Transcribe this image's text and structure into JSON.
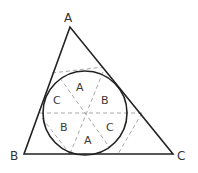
{
  "diagram": {
    "type": "geometry",
    "colors": {
      "solid": "#222222",
      "dashed": "#a0a0a0",
      "background": "#ffffff"
    },
    "vertices": {
      "A": {
        "label": "A",
        "x": 70,
        "y": 27
      },
      "B": {
        "label": "B",
        "x": 24,
        "y": 154
      },
      "C": {
        "label": "C",
        "x": 173,
        "y": 154
      }
    },
    "circle": {
      "cx": 85,
      "cy": 113,
      "r": 42
    },
    "regions": [
      {
        "label": "A",
        "x": 80,
        "y": 89
      },
      {
        "label": "B",
        "x": 105,
        "y": 103
      },
      {
        "label": "C",
        "x": 57,
        "y": 103
      },
      {
        "label": "B",
        "x": 64,
        "y": 130
      },
      {
        "label": "C",
        "x": 110,
        "y": 130
      },
      {
        "label": "A",
        "x": 88,
        "y": 143
      }
    ]
  }
}
